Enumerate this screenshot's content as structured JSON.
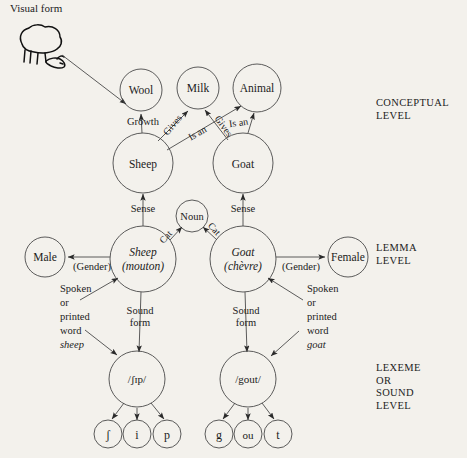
{
  "diagram": {
    "title_visual_form": "Visual form",
    "levels": {
      "conceptual": "CONCEPTUAL\nLEVEL",
      "lemma": "LEMMA\nLEVEL",
      "lexeme": "LEXEME\nOR\nSOUND\nLEVEL"
    },
    "concept_nodes": {
      "wool": "Wool",
      "milk": "Milk",
      "animal": "Animal",
      "sheep": "Sheep",
      "goat": "Goat"
    },
    "lemma_nodes": {
      "male": "Male",
      "female": "Female",
      "noun": "Noun",
      "sheep_lemma_line1": "Sheep",
      "sheep_lemma_line2": "(mouton)",
      "goat_lemma_line1": "Goat",
      "goat_lemma_line2": "(chèvre)"
    },
    "lexeme_nodes": {
      "sheep_sound": "/ʃɪp/",
      "goat_sound": "/gout/"
    },
    "phoneme_nodes": {
      "sheep": [
        "ʃ",
        "i",
        "p"
      ],
      "goat": [
        "g",
        "ou",
        "t"
      ]
    },
    "edge_labels": {
      "growth": "Growth",
      "gives_left": "Gives",
      "is_an_left": "Is an",
      "gives_right": "Gives",
      "is_an_right": "Is an",
      "sense_left": "Sense",
      "sense_right": "Sense",
      "cat_left": "Cat",
      "cat_right": "Cat",
      "gender_left": "(Gender)",
      "gender_right": "(Gender)",
      "sound_form_left_line1": "Sound",
      "sound_form_left_line2": "form",
      "sound_form_right_line1": "Sound",
      "sound_form_right_line2": "form"
    },
    "annotations": {
      "left_word_lines": [
        "Spoken",
        "or",
        "printed",
        "word"
      ],
      "left_word_italic": "sheep",
      "right_word_lines": [
        "Spoken",
        "or",
        "printed",
        "word"
      ],
      "right_word_italic": "goat"
    },
    "colors": {
      "background": "#f3f1ec",
      "ink": "#1b1b1b",
      "stroke": "#4a4a4a"
    }
  }
}
